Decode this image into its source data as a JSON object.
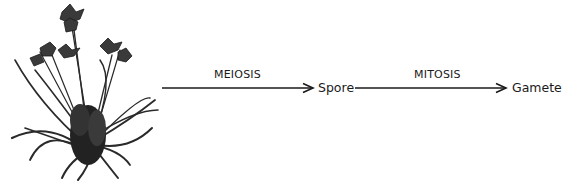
{
  "diagram": {
    "subject": {
      "illustration": "flowering-plant-illustration",
      "description": "daylily plant with flowers and long grass-like leaves"
    },
    "steps": [
      {
        "process": "MEIOSIS",
        "product": "Spore"
      },
      {
        "process": "MITOSIS",
        "product": "Gamete"
      }
    ],
    "colors": {
      "ink": "#1a1a1a",
      "background": "#ffffff"
    }
  }
}
